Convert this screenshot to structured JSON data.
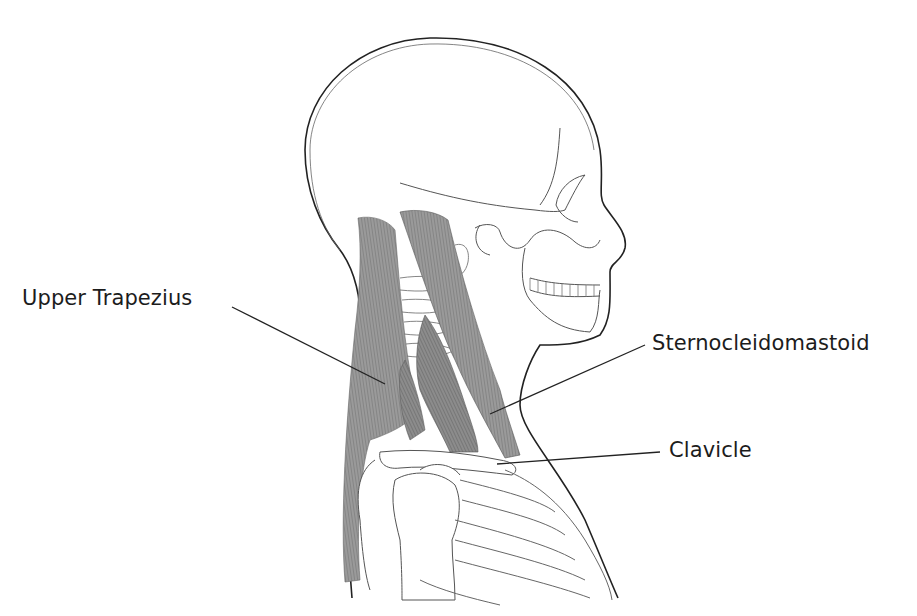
{
  "diagram": {
    "labels": [
      {
        "id": "upper-trapezius",
        "text": "Upper Trapezius",
        "x": 22,
        "y": 286,
        "line": [
          232,
          305,
          385,
          384
        ]
      },
      {
        "id": "sternocleidomastoid",
        "text": "Sternocleidomastoid",
        "x": 652,
        "y": 330,
        "line": [
          645,
          345,
          490,
          415
        ]
      },
      {
        "id": "clavicle",
        "text": "Clavicle",
        "x": 669,
        "y": 437,
        "line": [
          660,
          452,
          497,
          464
        ]
      }
    ],
    "colors": {
      "outline": "#222222",
      "bone_line": "#555555",
      "muscle_fill": "#8a8a8a",
      "muscle_dark": "#6e6e6e",
      "label_text": "#1c1c1c",
      "leader_line": "#222222"
    }
  }
}
